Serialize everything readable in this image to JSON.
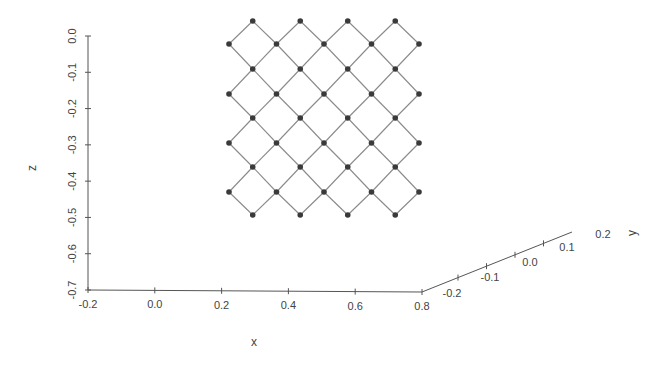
{
  "chart_data": {
    "type": "scatter",
    "subtype": "3d-wireframe-lattice",
    "title": "",
    "xlabel": "x",
    "ylabel": "y",
    "zlabel": "z",
    "x_ticks": [
      "-0.2",
      "0.0",
      "0.2",
      "0.4",
      "0.6",
      "0.8"
    ],
    "y_ticks": [
      "-0.2",
      "-0.1",
      "0.0",
      "0.1",
      "0.2"
    ],
    "z_ticks": [
      "0.0",
      "-0.1",
      "-0.2",
      "-0.3",
      "-0.4",
      "-0.5",
      "-0.6",
      "-0.7"
    ],
    "xlim": [
      -0.2,
      0.8
    ],
    "ylim": [
      -0.2,
      0.2
    ],
    "zlim": [
      -0.7,
      0.0
    ],
    "grid": false,
    "legend": null,
    "lattice": {
      "description": "Diamond (rotated square) mesh of nodes connected by edges, viewed roughly in the x-z plane at y≈0",
      "rows": 9,
      "nodes_per_row_pattern": [
        4,
        5,
        4,
        5,
        4,
        5,
        4,
        5,
        4
      ],
      "nodes_total": 40,
      "node_color": "#3a3a3a",
      "edge_color": "#8a8a8a",
      "x_range_approx": [
        0.28,
        0.72
      ],
      "z_range_approx": [
        -0.48,
        0.01
      ]
    }
  },
  "axes": {
    "x": {
      "title": "x",
      "ticks": [
        "-0.2",
        "0.0",
        "0.2",
        "0.4",
        "0.6",
        "0.8"
      ]
    },
    "y": {
      "title": "y",
      "ticks": [
        "-0.2",
        "-0.1",
        "0.0",
        "0.1",
        "0.2"
      ]
    },
    "z": {
      "title": "z",
      "ticks": [
        "0.0",
        "-0.1",
        "-0.2",
        "-0.3",
        "-0.4",
        "-0.5",
        "-0.6",
        "-0.7"
      ]
    }
  },
  "colors": {
    "axis": "#555555",
    "node": "#3a3a3a",
    "edge": "#8a8a8a",
    "text": "#444444"
  }
}
